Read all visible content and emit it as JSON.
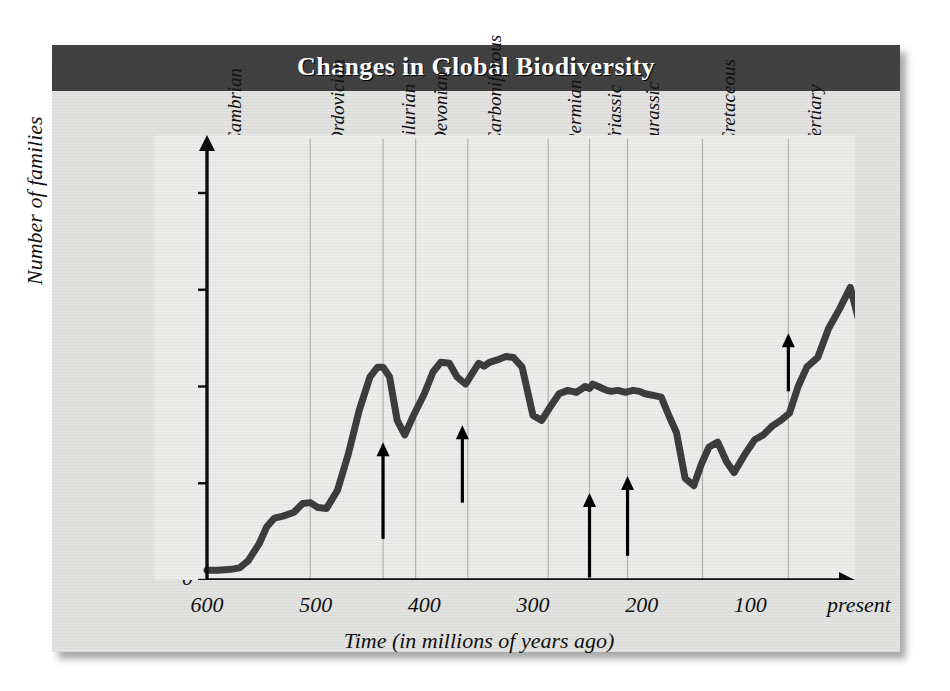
{
  "figure": {
    "title": "Changes in Global Biodiversity",
    "banner_color": "#414141",
    "plate_color": "#e2e2e0",
    "plot_bg_color": "#ececeb",
    "curve_color": "#3d3d3d",
    "axis_color": "#0d0d0d",
    "gridline_color": "#b3b3ae",
    "arrow_color": "#000000"
  },
  "chart_data": {
    "type": "line",
    "title": "Changes in Global Biodiversity",
    "xlabel": "Time (in millions of years ago)",
    "ylabel": "Number of families",
    "xlim": [
      600,
      0
    ],
    "ylim": [
      0,
      800
    ],
    "x_ticks": [
      "600",
      "500",
      "400",
      "300",
      "200",
      "100",
      "present"
    ],
    "x_tick_values": [
      600,
      500,
      400,
      300,
      200,
      100,
      0
    ],
    "y_ticks": [
      "0",
      "200",
      "400",
      "600",
      "800"
    ],
    "y_tick_values": [
      0,
      200,
      400,
      600,
      800
    ],
    "grid": "vertical-period-boundaries",
    "legend": "none",
    "x_axis_direction": "reversed",
    "series": [
      {
        "name": "Number of families",
        "x": [
          600,
          590,
          578,
          570,
          562,
          552,
          545,
          538,
          530,
          520,
          512,
          505,
          498,
          490,
          480,
          470,
          460,
          450,
          443,
          438,
          432,
          425,
          418,
          410,
          400,
          392,
          385,
          377,
          370,
          362,
          355,
          350,
          345,
          340,
          333,
          325,
          318,
          310,
          300,
          292,
          285,
          276,
          268,
          260,
          252,
          248,
          245,
          240,
          236,
          232,
          228,
          222,
          215,
          208,
          202,
          197,
          190,
          182,
          175,
          168,
          160,
          152,
          145,
          138,
          130,
          122,
          115,
          105,
          96,
          88,
          80,
          72,
          64,
          56,
          48,
          38,
          28,
          18,
          8,
          0
        ],
        "y": [
          20,
          20,
          22,
          25,
          40,
          75,
          110,
          128,
          132,
          140,
          158,
          160,
          150,
          148,
          185,
          260,
          350,
          420,
          440,
          440,
          420,
          330,
          300,
          340,
          385,
          430,
          450,
          448,
          420,
          405,
          430,
          448,
          442,
          450,
          455,
          462,
          460,
          440,
          340,
          330,
          355,
          385,
          392,
          388,
          400,
          396,
          405,
          400,
          396,
          392,
          390,
          392,
          388,
          392,
          390,
          385,
          382,
          378,
          340,
          305,
          210,
          195,
          240,
          275,
          285,
          245,
          222,
          260,
          290,
          300,
          318,
          330,
          345,
          400,
          440,
          460,
          520,
          560,
          605,
          535
        ],
        "y_note": "reconstructed family counts through geologic time"
      }
    ],
    "period_bands": [
      {
        "label": "Cambrian",
        "start_ma": 600,
        "end_ma": 505,
        "label_x_ma": 592
      },
      {
        "label": "Ordovician",
        "start_ma": 505,
        "end_ma": 438,
        "label_x_ma": 497
      },
      {
        "label": "Silurian",
        "start_ma": 438,
        "end_ma": 408,
        "label_x_ma": 432
      },
      {
        "label": "Devonian",
        "start_ma": 408,
        "end_ma": 360,
        "label_x_ma": 402
      },
      {
        "label": "Carboniferous",
        "start_ma": 360,
        "end_ma": 286,
        "label_x_ma": 352
      },
      {
        "label": "Permian",
        "start_ma": 286,
        "end_ma": 248,
        "label_x_ma": 279
      },
      {
        "label": "Triassic",
        "start_ma": 248,
        "end_ma": 213,
        "label_x_ma": 242
      },
      {
        "label": "Jurassic",
        "start_ma": 213,
        "end_ma": 144,
        "label_x_ma": 207
      },
      {
        "label": "Cretaceous",
        "start_ma": 144,
        "end_ma": 65,
        "label_x_ma": 137
      },
      {
        "label": "Tertiary",
        "start_ma": 65,
        "end_ma": 0,
        "label_x_ma": 58
      }
    ],
    "gridline_values_ma": [
      505,
      438,
      408,
      360,
      286,
      248,
      213,
      144,
      65
    ],
    "extinction_arrows": [
      {
        "name": "end-Ordovician",
        "x_ma": 438,
        "tip_y": 285,
        "tail_y": 85
      },
      {
        "name": "late-Devonian",
        "x_ma": 365,
        "tip_y": 320,
        "tail_y": 160
      },
      {
        "name": "end-Permian",
        "x_ma": 248,
        "tip_y": 180,
        "tail_y": 5
      },
      {
        "name": "end-Triassic",
        "x_ma": 213,
        "tip_y": 215,
        "tail_y": 50
      },
      {
        "name": "end-Cretaceous",
        "x_ma": 65,
        "tip_y": 510,
        "tail_y": 390
      }
    ]
  }
}
